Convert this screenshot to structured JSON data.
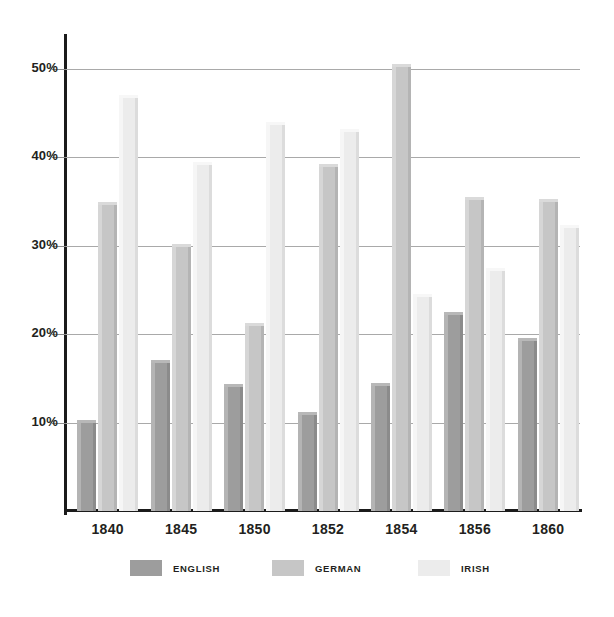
{
  "chart_data": {
    "type": "bar",
    "title": "",
    "subtitle": "",
    "xlabel": "",
    "ylabel": "",
    "categories": [
      "1840",
      "1845",
      "1850",
      "1852",
      "1854",
      "1856",
      "1860"
    ],
    "series": [
      {
        "name": "ENGLISH",
        "color": "#9d9d9d",
        "values": [
          10.3,
          17.1,
          14.4,
          11.2,
          14.5,
          22.5,
          19.6
        ]
      },
      {
        "name": "GERMAN",
        "color": "#c6c6c6",
        "values": [
          35.0,
          30.2,
          21.3,
          39.2,
          50.6,
          35.5,
          35.3
        ]
      },
      {
        "name": "IRISH",
        "color": "#ececec",
        "values": [
          47.0,
          39.5,
          44.0,
          43.2,
          24.6,
          27.5,
          32.4
        ]
      }
    ],
    "ylim": [
      0,
      53.5
    ],
    "yticks": [
      10,
      20,
      30,
      40,
      50
    ],
    "ytick_labels": [
      "10%",
      "20%",
      "30%",
      "40%",
      "50%"
    ],
    "grid": true,
    "legend_position": "bottom",
    "value_unit": "%"
  },
  "axis": {
    "y_tick_labels": [
      "50%",
      "40%",
      "30%",
      "20%",
      "10%"
    ]
  },
  "legend": {
    "items": [
      {
        "label": "ENGLISH"
      },
      {
        "label": "GERMAN"
      },
      {
        "label": "IRISH"
      }
    ]
  }
}
